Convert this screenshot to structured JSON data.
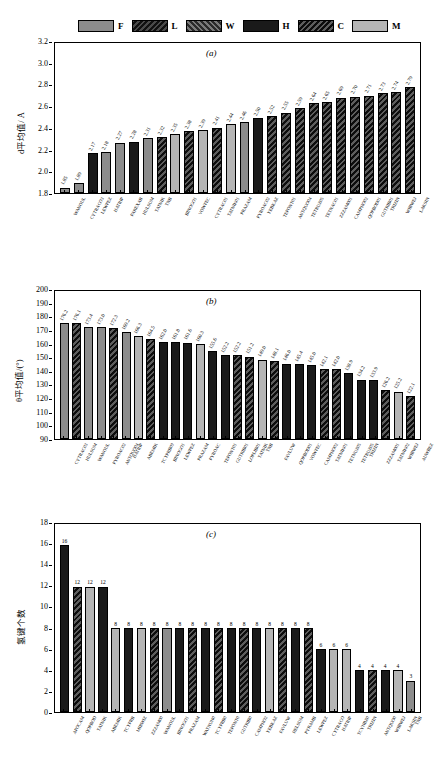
{
  "legend": {
    "items": [
      {
        "label": "F",
        "fill": "F",
        "color": "#8c8c8c"
      },
      {
        "label": "L",
        "fill": "L",
        "color": "#1a1a1a"
      },
      {
        "label": "W",
        "fill": "W",
        "color": "#3d3d3d"
      },
      {
        "label": "H",
        "fill": "H",
        "color": "#1a1a1a"
      },
      {
        "label": "C",
        "fill": "C",
        "color": "#0d0d0d"
      },
      {
        "label": "M",
        "fill": "M",
        "color": "#b5b5b5"
      }
    ]
  },
  "chart_data": [
    {
      "type": "bar",
      "panel": "(a)",
      "title": "",
      "xlabel": "",
      "ylabel": "d平均值/ Å",
      "ylim": [
        1.8,
        3.2
      ],
      "yticks": [
        1.8,
        2.0,
        2.2,
        2.4,
        2.6,
        2.8,
        3.0,
        3.2
      ],
      "ytick_labels": [
        "1.8",
        "2.0",
        "2.2",
        "2.4",
        "2.6",
        "2.8",
        "3.0",
        "3.2"
      ],
      "grid": false,
      "legend_position": "top",
      "categories": [
        "WANOUL",
        "CYTRACO3",
        "LEWPEZ",
        "HATRIP",
        "PAREXAB",
        "HULSUM",
        "TATNIK",
        "TNB",
        "BINOGO1",
        "VOWFEC",
        "CYTRAC01",
        "TATNIK01",
        "PRAZAM",
        "PYROAC02",
        "YEBKAZ",
        "TEPONT01",
        "ANTQUO04",
        "TETRUZ05",
        "TETNAC01",
        "ZZZAM001",
        "CAMPHO02",
        "QOPBOD01",
        "GUTRIB01",
        "TRIZIN",
        "WIBWEJ",
        "LAKSIN"
      ],
      "values": [
        1.85,
        1.89,
        2.17,
        2.18,
        2.27,
        2.28,
        2.31,
        2.32,
        2.35,
        2.38,
        2.39,
        2.41,
        2.44,
        2.46,
        2.5,
        2.52,
        2.55,
        2.59,
        2.64,
        2.65,
        2.69,
        2.7,
        2.71,
        2.73,
        2.74,
        2.79
      ],
      "value_labels": [
        "1.85",
        "1.89",
        "2.17",
        "2.18",
        "2.27",
        "2.28",
        "2.31",
        "2.32",
        "2.35",
        "2.38",
        "2.39",
        "2.41",
        "2.44",
        "2.46",
        "2.50",
        "2.52",
        "2.55",
        "2.59",
        "2.64",
        "2.65",
        "2.69",
        "2.70",
        "2.71",
        "2.73",
        "2.74",
        "2.79"
      ],
      "fills": [
        "F",
        "F",
        "H",
        "F",
        "F",
        "H",
        "F",
        "C",
        "M",
        "C",
        "M",
        "C",
        "M",
        "F",
        "H",
        "C",
        "C",
        "C",
        "C",
        "C",
        "C",
        "C",
        "C",
        "C",
        "C",
        "C"
      ]
    },
    {
      "type": "bar",
      "panel": "(b)",
      "title": "",
      "xlabel": "",
      "ylabel": "θ平均值/(°)",
      "ylim": [
        90,
        200
      ],
      "yticks": [
        90,
        100,
        110,
        120,
        130,
        140,
        150,
        160,
        170,
        180,
        190,
        200
      ],
      "ytick_labels": [
        "90",
        "100",
        "110",
        "120",
        "130",
        "140",
        "150",
        "160",
        "170",
        "180",
        "190",
        "200"
      ],
      "grid": false,
      "legend_position": "top",
      "categories": [
        "CYTRAC03",
        "HULSUM",
        "WANOUL",
        "PYROAC02",
        "ANTQUO04",
        "HATRIP",
        "ABEMIK",
        "TCYPRB09",
        "BINOGO1",
        "LEWPEZ",
        "PRAZAM",
        "PYROAC",
        "TEPONT01",
        "GUTRIB01",
        "LOPLIB01",
        "TATNIK",
        "TNB",
        "FAVLUW",
        "QOPBOD01",
        "VOWFEC",
        "CAMPHO02",
        "TATNIK01",
        "TETNUZ05",
        "TETRUZ05",
        "TRIZIN",
        "ZZZAM001",
        "TATNIK02",
        "WIBWEJ",
        "AUWBEZ"
      ],
      "values": [
        176.2,
        176.1,
        173.4,
        173.0,
        172.3,
        169.2,
        166.3,
        164.5,
        162.0,
        161.8,
        161.6,
        160.3,
        155.6,
        152.2,
        152.2,
        151.2,
        149.0,
        148.1,
        146.0,
        145.4,
        145.0,
        142.1,
        142.0,
        138.9,
        134.2,
        133.9,
        126.2,
        125.2,
        122.1
      ],
      "value_labels": [
        "176.2",
        "176.1",
        "173.4",
        "173.0",
        "172.3",
        "169.2",
        "166.3",
        "164.5",
        "162.0",
        "161.8",
        "161.6",
        "160.3",
        "155.6",
        "152.2",
        "152.2",
        "151.2",
        "149.0",
        "148.1",
        "146.0",
        "145.4",
        "145.0",
        "142.1",
        "142.0",
        "138.9",
        "134.2",
        "133.9",
        "126.2",
        "125.2",
        "122.1"
      ],
      "fills": [
        "F",
        "C",
        "F",
        "F",
        "C",
        "F",
        "M",
        "C",
        "H",
        "H",
        "H",
        "M",
        "H",
        "H",
        "C",
        "C",
        "M",
        "C",
        "H",
        "H",
        "H",
        "C",
        "C",
        "H",
        "H",
        "H",
        "C",
        "M",
        "C"
      ]
    },
    {
      "type": "bar",
      "panel": "(c)",
      "title": "",
      "xlabel": "",
      "ylabel": "氢键个数",
      "ylim": [
        0,
        18
      ],
      "yticks": [
        0,
        2,
        4,
        6,
        8,
        10,
        12,
        14,
        16,
        18
      ],
      "ytick_labels": [
        "0",
        "2",
        "4",
        "6",
        "8",
        "10",
        "12",
        "14",
        "16",
        "18"
      ],
      "grid": false,
      "legend_position": "top",
      "categories": [
        "APOCAM",
        "QOPBOD",
        "TATNIK",
        "ABEMIK",
        "TCYPRB",
        "MIRWIZ",
        "ZZZAM00",
        "WANOUL",
        "BINOGO1",
        "PRAZAM",
        "WATNUN0",
        "TCYPRB0",
        "TEPONT0",
        "GUTRIB0",
        "CAMPHO2",
        "YEBKAZ",
        "FAVLUW",
        "HELSUM",
        "PYRAMB",
        "LEWPEZ",
        "CYTRACO",
        "HATRIP",
        "TCYNBZ0",
        "TRIZIN",
        "ANTQUO0",
        "WIBWEJ",
        "LAKSIN",
        "TNB"
      ],
      "values": [
        16,
        12,
        12,
        12,
        8,
        8,
        8,
        8,
        8,
        8,
        8,
        8,
        8,
        8,
        8,
        8,
        8,
        8,
        8,
        8,
        6,
        6,
        6,
        4,
        4,
        4,
        4,
        3
      ],
      "value_labels": [
        "16",
        "12",
        "12",
        "12",
        "8",
        "8",
        "8",
        "8",
        "8",
        "8",
        "8",
        "8",
        "8",
        "8",
        "8",
        "8",
        "8",
        "8",
        "8",
        "8",
        "6",
        "6",
        "6",
        "4",
        "4",
        "4",
        "4",
        "3"
      ],
      "fills": [
        "H",
        "C",
        "M",
        "H",
        "M",
        "H",
        "M",
        "C",
        "F",
        "H",
        "C",
        "H",
        "C",
        "H",
        "C",
        "H",
        "M",
        "C",
        "H",
        "C",
        "H",
        "M",
        "M",
        "H",
        "C",
        "H",
        "M",
        "F"
      ]
    }
  ]
}
